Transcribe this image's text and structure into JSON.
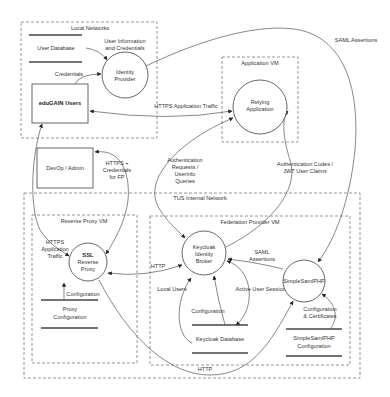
{
  "diagram": {
    "type": "data-flow-diagram",
    "boundaries": {
      "local_networks": "Local Networks",
      "application_vm": "Application VM",
      "tus_internal_network": "TUS Internal Network",
      "reverse_proxy_vm": "Reverse Proxy VM",
      "federation_provider_vm": "Federation Provider VM"
    },
    "external_entities": {
      "edugain_users": "eduGAIN Users",
      "devop_admin": "DevOp / Admin"
    },
    "processes": {
      "identity_provider": [
        "Identity",
        "Provider"
      ],
      "relying_application": [
        "Relying",
        "Application"
      ],
      "ssl_reverse_proxy": [
        "SSL",
        "Reverse",
        "Proxy"
      ],
      "keycloak_broker": [
        "Keycloak",
        "Identity",
        "Broker"
      ],
      "simplesamlphp": "SimpleSamlPHP"
    },
    "data_stores": {
      "user_database": "User Database",
      "proxy_configuration": [
        "Proxy",
        "Configuration"
      ],
      "keycloak_database": "Keycloak Database",
      "simplesamlphp_configuration": [
        "SimpleSamlPHP",
        "Configuration"
      ]
    },
    "flows": {
      "user_info_credentials": [
        "User Information",
        "and Credentials"
      ],
      "credentials": "Credentials",
      "saml_assertions_top": "SAML Assertions",
      "https_app_traffic": "HTTPS Application Traffic",
      "auth_requests": [
        "Authentication",
        "Requests /",
        "Userinfo",
        "Queries"
      ],
      "auth_codes": [
        "Authentication Codes /",
        "JWT User Claims"
      ],
      "https_credentials_fp": [
        "HTTPS +",
        "Credentials",
        "for FP"
      ],
      "https_app_traffic_proxy": [
        "HTTPS",
        "Application",
        "Traffic"
      ],
      "http_proxy_keycloak": "HTTP",
      "proxy_configuration_flow": "Configuration",
      "local_users": "Local Users",
      "keycloak_configuration": "Configuration",
      "active_user_sessions": "Active User Sessions",
      "saml_assertions_internal": [
        "SAML",
        "Assertions"
      ],
      "config_certificates": [
        "Configuration",
        "& Certificates"
      ],
      "http_bottom": "HTTP"
    }
  }
}
